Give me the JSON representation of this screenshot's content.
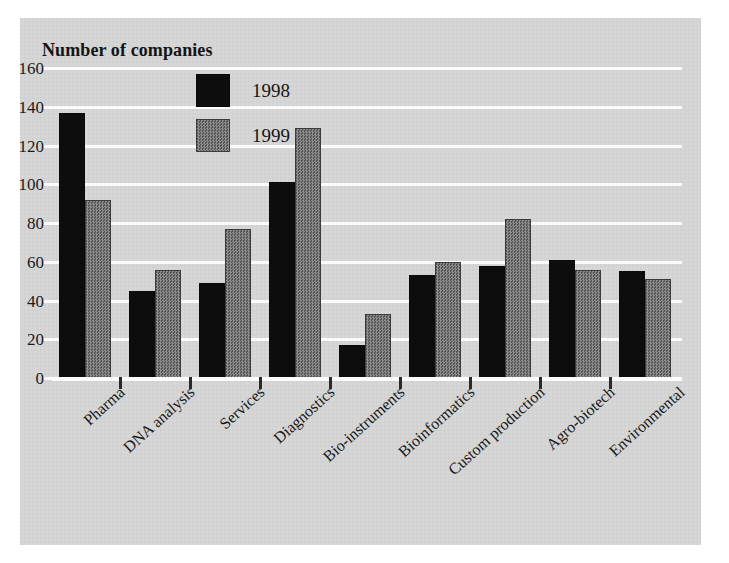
{
  "chart_data": {
    "type": "bar",
    "title": "Number of companies",
    "xlabel": "",
    "ylabel": "",
    "ylim": [
      0,
      160
    ],
    "yticks": [
      0,
      20,
      40,
      60,
      80,
      100,
      120,
      140,
      160
    ],
    "grid": true,
    "legend_position": "top-left-inside",
    "categories": [
      "Pharma",
      "DNA analysis",
      "Services",
      "Diagnostics",
      "Bio-instruments",
      "Bioinformatics",
      "Custom production",
      "Agro-biotech",
      "Environmental"
    ],
    "series": [
      {
        "name": "1998",
        "color": "#0d0d0d",
        "values": [
          137,
          45,
          49,
          101,
          17,
          53,
          58,
          61,
          55
        ]
      },
      {
        "name": "1999",
        "color": "#6e6e6e",
        "values": [
          92,
          56,
          77,
          129,
          33,
          60,
          82,
          56,
          51
        ]
      }
    ]
  },
  "figure": {
    "background_color": "#d6d6d6",
    "page_color": "#ffffff",
    "gridline_color": "#fbfbfb",
    "axis_color": "#fcfcfc",
    "text_color": "#141414"
  }
}
